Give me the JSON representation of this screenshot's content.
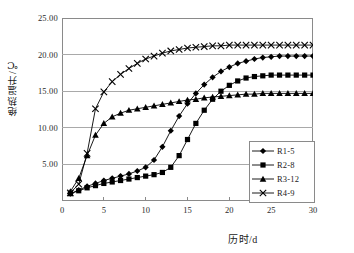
{
  "chart_data": {
    "type": "line",
    "title": "",
    "xlabel": "历时/d",
    "ylabel": "绝热温升/℃",
    "xlim": [
      0,
      30
    ],
    "ylim": [
      0,
      25
    ],
    "grid": true,
    "legend_position": "bottom-right-inside",
    "xticks": [
      "0",
      "5",
      "10",
      "15",
      "20",
      "25",
      "30"
    ],
    "yticks": [
      "5.00",
      "10.00",
      "15.00",
      "20.00",
      "25.00"
    ],
    "ytick_values": [
      5,
      10,
      15,
      20,
      25
    ],
    "xtick_values": [
      0,
      5,
      10,
      15,
      20,
      25,
      30
    ],
    "x": [
      1,
      2,
      3,
      4,
      5,
      6,
      7,
      8,
      9,
      10,
      11,
      12,
      13,
      14,
      15,
      16,
      17,
      18,
      19,
      20,
      21,
      22,
      23,
      24,
      25,
      26,
      27,
      28,
      29,
      30
    ],
    "series": [
      {
        "name": "R1-5",
        "marker": "diamond",
        "values": [
          1.0,
          1.5,
          2.0,
          2.4,
          2.8,
          3.1,
          3.4,
          3.7,
          4.1,
          4.6,
          5.6,
          7.4,
          9.6,
          11.6,
          13.3,
          14.7,
          15.9,
          16.9,
          17.7,
          18.3,
          18.8,
          19.1,
          19.4,
          19.6,
          19.7,
          19.8,
          19.8,
          19.8,
          19.8,
          19.8
        ]
      },
      {
        "name": "R2-8",
        "marker": "square",
        "values": [
          1.0,
          1.4,
          1.8,
          2.1,
          2.4,
          2.6,
          2.8,
          3.0,
          3.2,
          3.4,
          3.6,
          3.9,
          4.6,
          6.2,
          8.4,
          10.6,
          12.4,
          13.9,
          15.0,
          15.8,
          16.4,
          16.8,
          17.0,
          17.1,
          17.2,
          17.2,
          17.2,
          17.2,
          17.2,
          17.2
        ]
      },
      {
        "name": "R3-12",
        "marker": "triangle",
        "values": [
          1.3,
          3.1,
          6.2,
          9.0,
          10.6,
          11.5,
          12.0,
          12.4,
          12.6,
          12.8,
          13.0,
          13.2,
          13.4,
          13.6,
          13.8,
          13.9,
          14.1,
          14.2,
          14.3,
          14.4,
          14.5,
          14.6,
          14.6,
          14.7,
          14.7,
          14.7,
          14.7,
          14.7,
          14.7,
          14.7
        ]
      },
      {
        "name": "R4-9",
        "marker": "cross",
        "values": [
          1.1,
          2.3,
          6.5,
          12.6,
          14.9,
          16.3,
          17.3,
          18.1,
          18.8,
          19.4,
          19.8,
          20.2,
          20.5,
          20.7,
          20.9,
          21.0,
          21.1,
          21.2,
          21.2,
          21.3,
          21.3,
          21.3,
          21.3,
          21.3,
          21.3,
          21.3,
          21.3,
          21.3,
          21.3,
          21.3
        ]
      }
    ]
  },
  "legend": {
    "items": [
      {
        "label": "R1-5",
        "marker": "diamond"
      },
      {
        "label": "R2-8",
        "marker": "square"
      },
      {
        "label": "R3-12",
        "marker": "triangle"
      },
      {
        "label": "R4-9",
        "marker": "cross"
      }
    ]
  },
  "colors": {
    "series": "#000000",
    "grid": "#a9a9a9",
    "frame": "#8a8a8a",
    "text": "#1a1a1a",
    "background": "#ffffff"
  }
}
